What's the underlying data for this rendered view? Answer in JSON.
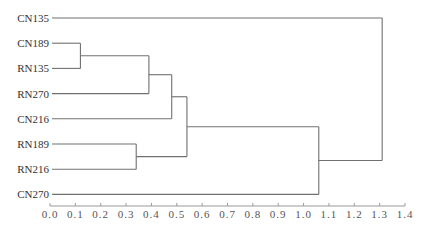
{
  "chart_data": {
    "type": "dendrogram",
    "title": "",
    "xlabel": "",
    "ylabel": "",
    "orientation": "horizontal",
    "xlim": [
      0.0,
      1.4
    ],
    "grid": false,
    "x_ticks": [
      "0.0",
      "0.1",
      "0.2",
      "0.3",
      "0.4",
      "0.5",
      "0.6",
      "0.7",
      "0.8",
      "0.9",
      "1.0",
      "1.1",
      "1.2",
      "1.3",
      "1.4"
    ],
    "leaves": [
      "CN135",
      "CN189",
      "RN135",
      "RN270",
      "CN216",
      "RN189",
      "RN216",
      "CN270"
    ],
    "merges": [
      {
        "id": "m1",
        "children": [
          "CN189",
          "RN135"
        ],
        "height": 0.12
      },
      {
        "id": "m2",
        "children": [
          "RN189",
          "RN216"
        ],
        "height": 0.34
      },
      {
        "id": "m3",
        "children": [
          "m1",
          "RN270"
        ],
        "height": 0.39
      },
      {
        "id": "m4",
        "children": [
          "m3",
          "CN216"
        ],
        "height": 0.48
      },
      {
        "id": "m5",
        "children": [
          "m4",
          "m2"
        ],
        "height": 0.54
      },
      {
        "id": "m6",
        "children": [
          "m5",
          "CN270"
        ],
        "height": 1.06
      },
      {
        "id": "m7",
        "children": [
          "CN135",
          "m6"
        ],
        "height": 1.31
      }
    ],
    "colors": {
      "branch": "#707070",
      "axis": "#9a9a9a",
      "text": "#333333"
    }
  }
}
